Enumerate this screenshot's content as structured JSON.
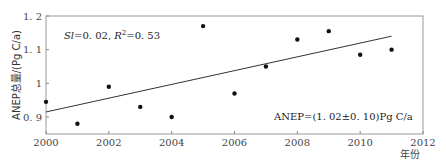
{
  "chart_data": {
    "type": "scatter",
    "title": "",
    "xlabel": "年份",
    "ylabel": "ANEP总量/(Pg C/a)",
    "xlim": [
      2000,
      2012
    ],
    "ylim": [
      0.85,
      1.2
    ],
    "x_ticks": [
      2000,
      2002,
      2004,
      2006,
      2008,
      2010,
      2012
    ],
    "x_tick_labels": [
      "2000",
      "2002",
      "2004",
      "2006",
      "2008",
      "2010",
      "2012"
    ],
    "y_ticks": [
      0.9,
      1.0,
      1.1,
      1.2
    ],
    "y_tick_labels": [
      "0. 9",
      "1",
      "1. 1",
      "1. 2"
    ],
    "grid": false,
    "legend": null,
    "series": [
      {
        "name": "ANEP",
        "type": "scatter",
        "x": [
          2000,
          2001,
          2002,
          2003,
          2004,
          2005,
          2006,
          2007,
          2008,
          2009,
          2010,
          2011
        ],
        "values": [
          0.945,
          0.88,
          0.99,
          0.93,
          0.9,
          1.17,
          0.97,
          1.05,
          1.13,
          1.155,
          1.085,
          1.1
        ]
      },
      {
        "name": "trend",
        "type": "line",
        "x": [
          2000,
          2011
        ],
        "values": [
          0.915,
          1.14
        ]
      }
    ],
    "annotations": [
      {
        "text": "Sl=0. 02, R²=0. 53",
        "position": "upper-left"
      },
      {
        "text": "ANEP=(1. 02±0. 10)Pg C/a",
        "position": "lower-right"
      }
    ]
  },
  "labels": {
    "ylabel": "ANEP总量/(Pg C/a)",
    "xlabel": "年份",
    "annot_slope_prefix": "Sl",
    "annot_slope_rest": "=0. 02, ",
    "annot_r": "R",
    "annot_r_sup": "2",
    "annot_r_rest": "=0. 53",
    "annot_mean": "ANEP=(1. 02±0. 10)Pg C/a"
  }
}
